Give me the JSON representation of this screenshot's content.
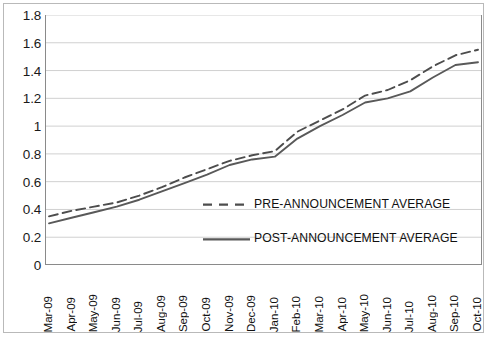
{
  "chart_data": {
    "type": "line",
    "title": "",
    "subtitle": "",
    "xlabel": "",
    "ylabel": "",
    "ylim": [
      0,
      1.8
    ],
    "ytick_step": 0.2,
    "yticks": [
      "1.8",
      "1.6",
      "1.4",
      "1.2",
      "1",
      "0.8",
      "0.6",
      "0.4",
      "0.2",
      "0"
    ],
    "ytick_values": [
      1.8,
      1.6,
      1.4,
      1.2,
      1.0,
      0.8,
      0.6,
      0.4,
      0.2,
      0
    ],
    "grid": "horizontal",
    "legend_position": "inside-center-right",
    "categories": [
      "Mar-09",
      "Apr-09",
      "May-09",
      "Jun-09",
      "Jul-09",
      "Aug-09",
      "Sep-09",
      "Oct-09",
      "Nov-09",
      "Dec-09",
      "Jan-10",
      "Feb-10",
      "Mar-10",
      "Apr-10",
      "May-10",
      "Jun-10",
      "Jul-10",
      "Aug-10",
      "Sep-10",
      "Oct-10"
    ],
    "series": [
      {
        "name": "PRE-ANNOUNCEMENT AVERAGE",
        "style": "dashed",
        "color": "#4d4d4d",
        "values": [
          0.35,
          0.39,
          0.42,
          0.45,
          0.5,
          0.56,
          0.63,
          0.69,
          0.75,
          0.79,
          0.82,
          0.96,
          1.04,
          1.12,
          1.22,
          1.26,
          1.33,
          1.43,
          1.51,
          1.55
        ]
      },
      {
        "name": "POST-ANNOUNCEMENT AVERAGE",
        "style": "solid",
        "color": "#595959",
        "values": [
          0.3,
          0.34,
          0.38,
          0.42,
          0.47,
          0.53,
          0.59,
          0.65,
          0.72,
          0.76,
          0.78,
          0.91,
          1.0,
          1.08,
          1.17,
          1.2,
          1.25,
          1.35,
          1.44,
          1.46
        ]
      }
    ]
  },
  "legend": {
    "entries": [
      {
        "label": "PRE-ANNOUNCEMENT AVERAGE",
        "style": "dashed"
      },
      {
        "label": "POST-ANNOUNCEMENT AVERAGE",
        "style": "solid"
      }
    ]
  },
  "colors": {
    "grid": "#d0d0d0",
    "axis": "#8a8a8a",
    "frame": "#b9b9b9",
    "text": "#111111",
    "series_pre": "#4d4d4d",
    "series_post": "#595959",
    "background": "#ffffff"
  }
}
